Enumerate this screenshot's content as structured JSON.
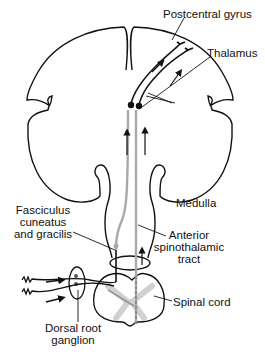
{
  "diagram": {
    "type": "anatomical pathway diagram",
    "labels": {
      "postcentral_gyrus": "Postcentral gyrus",
      "thalamus": "Thalamus",
      "medulla": "Medulla",
      "fasciculus_line1": "Fasciculus",
      "fasciculus_line2": "cuneatus",
      "fasciculus_line3": "and gracilis",
      "anterior_line1": "Anterior",
      "anterior_line2": "spinothalamic",
      "anterior_line3": "tract",
      "spinal_cord": "Spinal cord",
      "drg_line1": "Dorsal root",
      "drg_line2": "ganglion"
    },
    "colors": {
      "outline": "#111111",
      "tract_gray": "#a9a9a9",
      "gray_matter": "#d4d4d4",
      "background": "#ffffff"
    }
  }
}
